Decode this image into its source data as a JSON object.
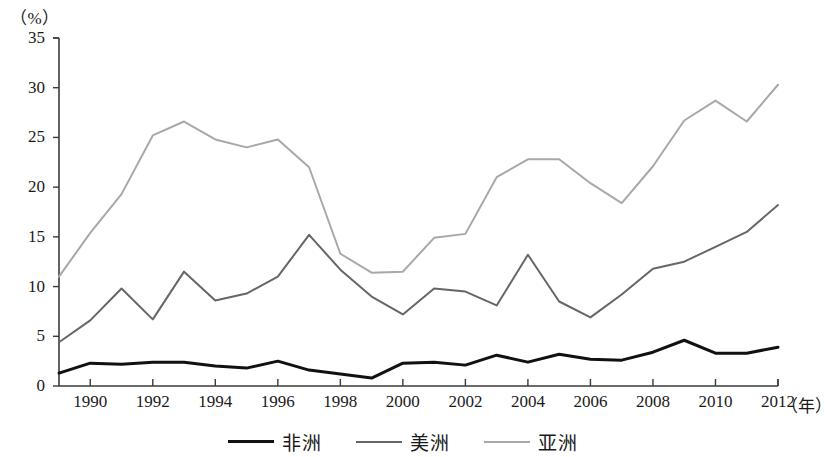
{
  "chart_data": {
    "type": "line",
    "title": "",
    "subtitle": "",
    "ylabel": "（%）",
    "xlabel": "（年）",
    "xlim": [
      1989,
      2012
    ],
    "ylim": [
      0,
      35
    ],
    "yticks": [
      0,
      5,
      10,
      15,
      20,
      25,
      30,
      35
    ],
    "xticks": [
      1990,
      1992,
      1994,
      1996,
      1998,
      2000,
      2002,
      2004,
      2006,
      2008,
      2010,
      2012
    ],
    "x": [
      1989,
      1990,
      1991,
      1992,
      1993,
      1994,
      1995,
      1996,
      1997,
      1998,
      1999,
      2000,
      2001,
      2002,
      2003,
      2004,
      2005,
      2006,
      2007,
      2008,
      2009,
      2010,
      2011,
      2012
    ],
    "grid": false,
    "legend_position": "bottom-center",
    "series": [
      {
        "name": "非洲",
        "color": "#111111",
        "line_width": 3,
        "values": [
          1.3,
          2.3,
          2.2,
          2.4,
          2.4,
          2.0,
          1.8,
          2.5,
          1.6,
          1.2,
          0.8,
          2.3,
          2.4,
          2.1,
          3.1,
          2.4,
          3.2,
          2.7,
          2.6,
          3.4,
          4.6,
          3.3,
          3.3,
          3.9
        ]
      },
      {
        "name": "美洲",
        "color": "#666666",
        "line_width": 2,
        "values": [
          4.4,
          6.6,
          9.8,
          6.7,
          11.5,
          8.6,
          9.3,
          11.0,
          15.2,
          11.7,
          9.0,
          7.2,
          9.8,
          9.5,
          8.1,
          13.2,
          8.5,
          6.9,
          9.2,
          11.8,
          12.5,
          14.0,
          15.5,
          18.2
        ]
      },
      {
        "name": "亚洲",
        "color": "#a8a8a8",
        "line_width": 2,
        "values": [
          11.0,
          15.4,
          19.3,
          25.2,
          26.6,
          24.8,
          24.0,
          24.8,
          22.0,
          13.3,
          11.4,
          11.5,
          14.9,
          15.3,
          21.0,
          22.8,
          22.8,
          20.4,
          18.4,
          22.1,
          26.7,
          28.7,
          26.6,
          30.3
        ]
      }
    ]
  },
  "legend": {
    "items": [
      {
        "label": "非洲"
      },
      {
        "label": "美洲"
      },
      {
        "label": "亚洲"
      }
    ]
  },
  "axes": {
    "y_unit_text": "（%）",
    "x_unit_text": "（年）",
    "ytick_labels": [
      "35",
      "30",
      "25",
      "20",
      "15",
      "10",
      "5",
      "0"
    ],
    "xtick_labels": [
      "1990",
      "1992",
      "1994",
      "1996",
      "1998",
      "2000",
      "2002",
      "2004",
      "2006",
      "2008",
      "2010",
      "2012"
    ]
  },
  "colors": {
    "africa": "#111111",
    "americas": "#666666",
    "asia": "#a8a8a8",
    "axis": "#3a3a3a",
    "background": "#ffffff"
  }
}
